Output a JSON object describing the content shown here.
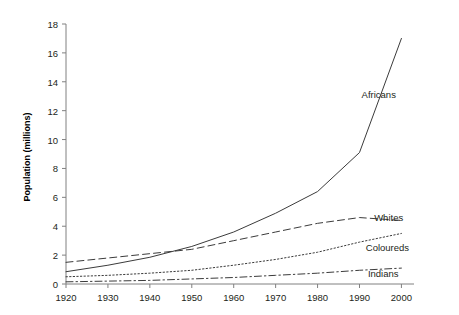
{
  "chart_data": {
    "type": "line",
    "title": "",
    "xlabel": "",
    "ylabel": "Population (millions)",
    "xlim": [
      1920,
      2003
    ],
    "ylim": [
      0,
      18
    ],
    "xticks": [
      1920,
      1930,
      1940,
      1950,
      1960,
      1970,
      1980,
      1990,
      2000
    ],
    "yticks": [
      0,
      2,
      4,
      6,
      8,
      10,
      12,
      14,
      16,
      18
    ],
    "grid": false,
    "legend_position": "inline-right-of-line-ends",
    "x": [
      1920,
      1930,
      1940,
      1950,
      1960,
      1970,
      1980,
      1990,
      2000
    ],
    "series": [
      {
        "name": "Africans",
        "style": "solid",
        "color": "#3b3b3b",
        "values": [
          0.85,
          1.3,
          1.85,
          2.6,
          3.6,
          4.9,
          6.4,
          9.1,
          17.0
        ],
        "label_x": 1990.5,
        "label_y": 13.1
      },
      {
        "name": "Whites",
        "style": "dashed",
        "color": "#3b3b3b",
        "values": [
          1.5,
          1.8,
          2.1,
          2.4,
          3.0,
          3.6,
          4.2,
          4.6,
          4.4
        ],
        "label_x": 1993.5,
        "label_y": 4.55
      },
      {
        "name": "Coloureds",
        "style": "dotted",
        "color": "#3b3b3b",
        "values": [
          0.5,
          0.6,
          0.75,
          0.95,
          1.3,
          1.7,
          2.2,
          2.9,
          3.5
        ],
        "label_x": 1991.5,
        "label_y": 2.5
      },
      {
        "name": "Indians",
        "style": "dashdot",
        "color": "#3b3b3b",
        "values": [
          0.15,
          0.2,
          0.25,
          0.35,
          0.45,
          0.6,
          0.75,
          0.95,
          1.1
        ],
        "label_x": 1992.0,
        "label_y": 0.72
      }
    ]
  },
  "axes": {
    "y_title": "Population (millions)",
    "y_tick_labels": [
      "0",
      "2",
      "4",
      "6",
      "8",
      "10",
      "12",
      "14",
      "16",
      "18"
    ],
    "x_tick_labels": [
      "1920",
      "1930",
      "1940",
      "1950",
      "1960",
      "1970",
      "1980",
      "1990",
      "2000"
    ]
  },
  "series_labels": {
    "africans": "Africans",
    "whites": "Whites",
    "coloureds": "Coloureds",
    "indians": "Indians"
  },
  "colors": {
    "line": "#3b3b3b",
    "axis": "#808080",
    "text": "#231f20",
    "background": "#ffffff"
  }
}
